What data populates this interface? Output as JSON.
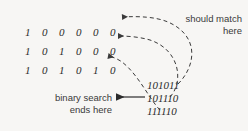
{
  "figure": {
    "background_color": "#f7f6f4",
    "ink_color": "#2b2b2b"
  },
  "bit_rows": [
    {
      "id": "row-0",
      "bits": [
        "1",
        "0",
        "0",
        "0",
        "0",
        "0"
      ]
    },
    {
      "id": "row-1",
      "bits": [
        "1",
        "0",
        "1",
        "0",
        "0",
        "0"
      ]
    },
    {
      "id": "row-2",
      "bits": [
        "1",
        "0",
        "1",
        "0",
        "1",
        "0"
      ]
    }
  ],
  "code_lines": [
    {
      "id": "code-0",
      "text": "101011"
    },
    {
      "id": "code-1",
      "text": "101110"
    },
    {
      "id": "code-2",
      "text": "111110"
    }
  ],
  "annotations": {
    "should_match": "should match\nhere",
    "binary_search": "binary search\nends here"
  }
}
